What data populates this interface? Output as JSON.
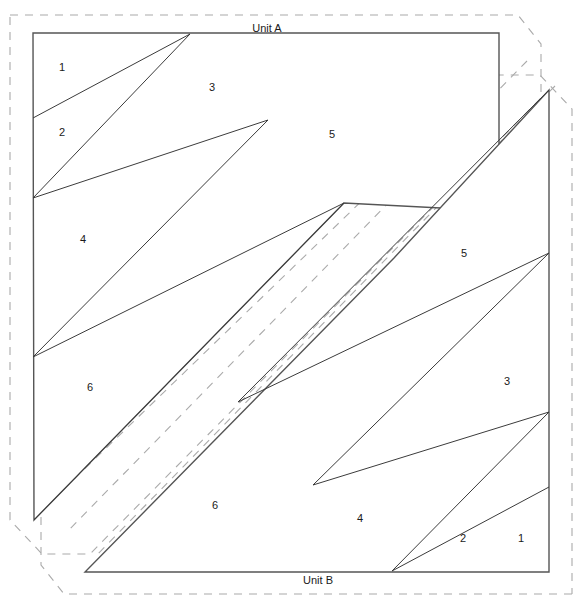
{
  "document": {
    "title": "Quilt Paper Piecing Pattern Sheet",
    "background_color": "#ffffff"
  },
  "colors": {
    "solid_line": "#3b3b3b",
    "outline_line": "#555555",
    "dashed_line": "#aaaaaa",
    "label_text": "#1a1a1a",
    "paper": "#ffffff"
  },
  "units": [
    {
      "id": "unit-a",
      "label": "Unit A",
      "label_position": {
        "x": 267,
        "y": 29
      },
      "outline": "33,33 499,33 499,211 344,203 34,520 33,33",
      "regions": [
        {
          "number": "1",
          "x": 62,
          "y": 68
        },
        {
          "number": "2",
          "x": 62,
          "y": 133
        },
        {
          "number": "3",
          "x": 212,
          "y": 88
        },
        {
          "number": "4",
          "x": 83,
          "y": 240
        },
        {
          "number": "5",
          "x": 332,
          "y": 135
        },
        {
          "number": "6",
          "x": 90,
          "y": 388
        }
      ]
    },
    {
      "id": "unit-b",
      "label": "Unit B",
      "label_position": {
        "x": 318,
        "y": 581
      },
      "outline": "549,90 549,572 85,572 394,258 549,90",
      "regions": [
        {
          "number": "1",
          "x": 521,
          "y": 539
        },
        {
          "number": "2",
          "x": 463,
          "y": 539
        },
        {
          "number": "3",
          "x": 507,
          "y": 382
        },
        {
          "number": "4",
          "x": 360,
          "y": 519
        },
        {
          "number": "5",
          "x": 464,
          "y": 254
        },
        {
          "number": "6",
          "x": 215,
          "y": 506
        }
      ]
    }
  ],
  "seam_allowance": {
    "description": "dashed cutting line offset around each unit",
    "unit_a_path": "10,15 518,15 541,44 541,98 90,554 42,554 10,520 10,15",
    "unit_b_path": "572,594 64,594 41,565 41,511 492,75 540,75 572,109 572,594",
    "unit_a_inner_diagonal": "527,61 66,533",
    "unit_b_inner_diagonal": "555,86 94,558"
  },
  "line_segments": {
    "unit_a": [
      "190,34 33,118",
      "190,34 33,198",
      "268,120 33,198",
      "268,120 33,357",
      "344,203 33,357",
      "344,203 34,520"
    ],
    "unit_b": [
      "392,571 549,487",
      "392,571 549,412",
      "313,485 549,412",
      "313,485 549,253",
      "238,402 549,253",
      "238,402 549,90"
    ]
  }
}
